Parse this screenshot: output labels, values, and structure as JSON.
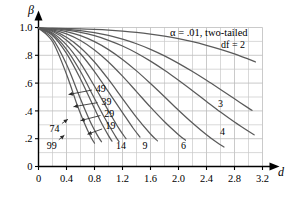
{
  "chart_data": {
    "type": "line",
    "title": "",
    "annotation": "α = .01, two-tailed",
    "xlabel": "d",
    "ylabel": "β",
    "xlim": [
      0,
      3.2
    ],
    "ylim": [
      0,
      1.0
    ],
    "grid": true,
    "x_ticks": [
      0,
      0.4,
      0.8,
      1.2,
      1.6,
      2.0,
      2.4,
      2.8,
      3.2
    ],
    "x_tick_labels": [
      "0",
      "0.4",
      "0.8",
      "1.2",
      "1.6",
      "2.0",
      "2.4",
      "2.8",
      "3.2"
    ],
    "x_minor_step": 0.2,
    "y_ticks": [
      0,
      0.2,
      0.4,
      0.6,
      0.8,
      1.0
    ],
    "y_tick_labels": [
      "0",
      ".2",
      ".4",
      ".6",
      ".8",
      "1.0"
    ],
    "y_minor_step": 0.1,
    "legend_position": "inline-curve-labels",
    "series": [
      {
        "name": "df = 2",
        "label": "df = 2",
        "label_x": 2.78,
        "label_y": 0.875,
        "leader": false,
        "x": [
          0.0,
          0.2,
          0.4,
          0.6,
          0.8,
          1.0,
          1.2,
          1.4,
          1.6,
          1.8,
          2.0,
          2.2,
          2.4,
          2.6,
          2.8,
          3.0,
          3.1
        ],
        "y": [
          0.995,
          0.994,
          0.992,
          0.99,
          0.986,
          0.981,
          0.974,
          0.965,
          0.953,
          0.938,
          0.92,
          0.898,
          0.872,
          0.843,
          0.81,
          0.772,
          0.752
        ]
      },
      {
        "name": "df = 3",
        "label": "3",
        "label_x": 2.6,
        "label_y": 0.452,
        "leader": false,
        "x": [
          0.0,
          0.2,
          0.4,
          0.6,
          0.8,
          1.0,
          1.2,
          1.4,
          1.6,
          1.8,
          2.0,
          2.2,
          2.4,
          2.6,
          2.8,
          3.0,
          3.05
        ],
        "y": [
          0.995,
          0.993,
          0.987,
          0.978,
          0.963,
          0.943,
          0.916,
          0.883,
          0.843,
          0.796,
          0.742,
          0.683,
          0.62,
          0.554,
          0.487,
          0.42,
          0.404
        ]
      },
      {
        "name": "df = 4",
        "label": "4",
        "label_x": 2.63,
        "label_y": 0.252,
        "leader": false,
        "x": [
          0.0,
          0.2,
          0.4,
          0.6,
          0.8,
          1.0,
          1.2,
          1.4,
          1.6,
          1.8,
          2.0,
          2.2,
          2.4,
          2.6,
          2.8,
          3.0,
          3.08
        ],
        "y": [
          0.995,
          0.991,
          0.981,
          0.965,
          0.941,
          0.908,
          0.867,
          0.817,
          0.758,
          0.692,
          0.62,
          0.545,
          0.468,
          0.392,
          0.32,
          0.253,
          0.228
        ]
      },
      {
        "name": "df = 6",
        "label": "6",
        "label_x": 2.07,
        "label_y": 0.148,
        "leader": false,
        "x": [
          0.0,
          0.2,
          0.4,
          0.6,
          0.8,
          1.0,
          1.2,
          1.4,
          1.6,
          1.8,
          2.0,
          2.2,
          2.4,
          2.55,
          2.65
        ],
        "y": [
          0.995,
          0.988,
          0.97,
          0.941,
          0.898,
          0.841,
          0.77,
          0.688,
          0.597,
          0.502,
          0.405,
          0.313,
          0.228,
          0.172,
          0.14
        ]
      },
      {
        "name": "df = 9",
        "label": "9",
        "label_x": 1.52,
        "label_y": 0.148,
        "leader": false,
        "x": [
          0.0,
          0.2,
          0.4,
          0.6,
          0.8,
          1.0,
          1.2,
          1.4,
          1.6,
          1.8,
          2.0,
          2.1
        ],
        "y": [
          0.995,
          0.983,
          0.954,
          0.906,
          0.838,
          0.752,
          0.65,
          0.539,
          0.427,
          0.322,
          0.229,
          0.189
        ]
      },
      {
        "name": "df = 14",
        "label": "14",
        "label_x": 1.18,
        "label_y": 0.148,
        "leader": false,
        "x": [
          0.0,
          0.2,
          0.4,
          0.6,
          0.8,
          1.0,
          1.2,
          1.4,
          1.6,
          1.7
        ],
        "y": [
          0.995,
          0.977,
          0.93,
          0.855,
          0.752,
          0.626,
          0.489,
          0.354,
          0.234,
          0.184
        ]
      },
      {
        "name": "df = 19",
        "label": "19",
        "label_x": 1.03,
        "label_y": 0.292,
        "leader": true,
        "leader_to_x": 0.7,
        "leader_to_y": 0.232,
        "x": [
          0.0,
          0.2,
          0.4,
          0.6,
          0.8,
          1.0,
          1.2,
          1.35,
          1.45
        ],
        "y": [
          0.995,
          0.971,
          0.909,
          0.811,
          0.683,
          0.537,
          0.388,
          0.277,
          0.212
        ]
      },
      {
        "name": "df = 29",
        "label": "29",
        "label_x": 1.01,
        "label_y": 0.383,
        "leader": true,
        "leader_to_x": 0.6,
        "leader_to_y": 0.33,
        "x": [
          0.0,
          0.2,
          0.4,
          0.6,
          0.8,
          1.0,
          1.15,
          1.25
        ],
        "y": [
          0.995,
          0.961,
          0.875,
          0.744,
          0.577,
          0.4,
          0.272,
          0.2
        ]
      },
      {
        "name": "df = 39",
        "label": "39",
        "label_x": 0.97,
        "label_y": 0.47,
        "leader": true,
        "leader_to_x": 0.5,
        "leader_to_y": 0.43,
        "x": [
          0.0,
          0.2,
          0.4,
          0.6,
          0.8,
          0.95,
          1.1,
          1.15
        ],
        "y": [
          0.995,
          0.952,
          0.843,
          0.683,
          0.489,
          0.345,
          0.217,
          0.18
        ]
      },
      {
        "name": "df = 49",
        "label": "49",
        "label_x": 0.89,
        "label_y": 0.562,
        "leader": true,
        "leader_to_x": 0.43,
        "leader_to_y": 0.518,
        "x": [
          0.0,
          0.2,
          0.4,
          0.6,
          0.8,
          0.9,
          1.0,
          1.05
        ],
        "y": [
          0.995,
          0.943,
          0.814,
          0.63,
          0.417,
          0.313,
          0.222,
          0.182
        ]
      },
      {
        "name": "df = 74",
        "label": "74",
        "label_x": 0.23,
        "label_y": 0.272,
        "leader": true,
        "leader_to_x": 0.42,
        "leader_to_y": 0.34,
        "x": [
          0.0,
          0.2,
          0.4,
          0.6,
          0.75,
          0.85,
          0.9
        ],
        "y": [
          0.995,
          0.92,
          0.735,
          0.486,
          0.311,
          0.217,
          0.178
        ]
      },
      {
        "name": "df = 99",
        "label": "99",
        "label_x": 0.19,
        "label_y": 0.152,
        "leader": true,
        "leader_to_x": 0.37,
        "leader_to_y": 0.225,
        "x": [
          0.0,
          0.2,
          0.4,
          0.55,
          0.65,
          0.75,
          0.8
        ],
        "y": [
          0.995,
          0.899,
          0.664,
          0.446,
          0.319,
          0.21,
          0.168
        ]
      }
    ]
  },
  "colors": {
    "curve": "#5a5a5a",
    "grid": "#c8c8c8",
    "axis": "#000000",
    "text": "#000000",
    "background": "#ffffff"
  }
}
